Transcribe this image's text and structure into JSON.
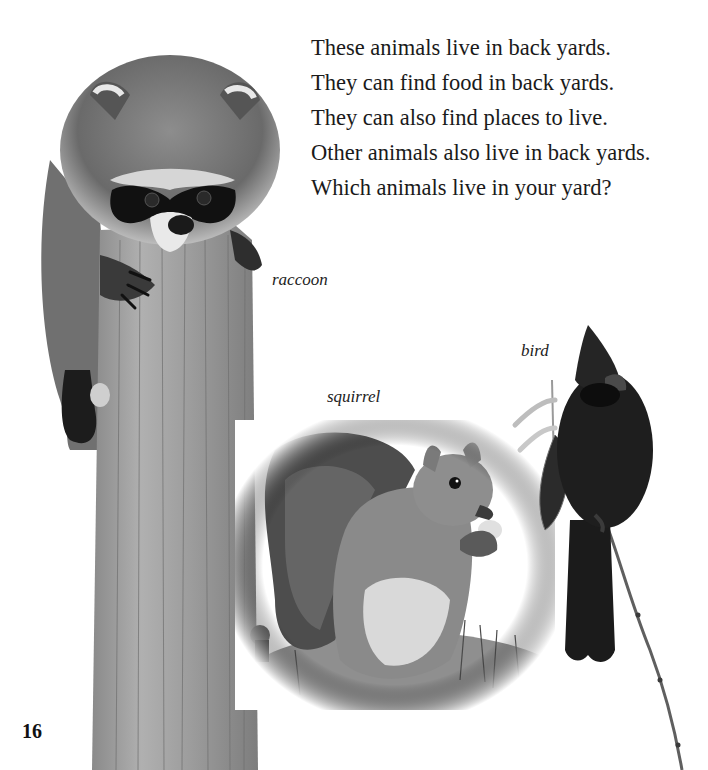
{
  "page": {
    "number": "16",
    "body_lines": [
      "These animals live in back yards.",
      "They can find food in back yards.",
      "They can also find places to live.",
      "Other animals also live in back yards.",
      "Which animals live in your yard?"
    ],
    "captions": {
      "raccoon": "raccoon",
      "squirrel": "squirrel",
      "bird": "bird"
    }
  },
  "images": [
    {
      "subject": "raccoon",
      "description": "raccoon on a wooden post"
    },
    {
      "subject": "squirrel",
      "description": "gray squirrel eating, sitting in grass"
    },
    {
      "subject": "bird",
      "description": "cardinal perched on a twig"
    }
  ],
  "colors": {
    "background": "#ffffff",
    "text": "#1a1a1a",
    "post_wood": "#9a9a9a",
    "raccoon_mask": "#111111",
    "bird_body": "#1e1e1e"
  }
}
